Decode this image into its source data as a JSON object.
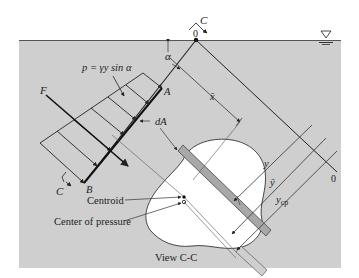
{
  "figure": {
    "pressure_formula": "p = γy sin α",
    "labels": {
      "F": "F",
      "A": "A",
      "B": "B",
      "C_top": "C",
      "C_bottom": "C",
      "origin_top": "0",
      "origin_right": "0",
      "alpha": "α",
      "dA": "dA",
      "xbar": "x̄",
      "y": "y",
      "ybar": "ȳ",
      "ycp_main": "y",
      "ycp_sub": "cp",
      "centroid": "Centroid",
      "center_of_pressure": "Center of pressure",
      "view": "View C-C"
    },
    "colors": {
      "water": "#cfcfcf",
      "surface_line": "#555555",
      "ink": "#222222",
      "area_fill": "#ffffff",
      "strip_fill": "#a8a8a8"
    }
  }
}
